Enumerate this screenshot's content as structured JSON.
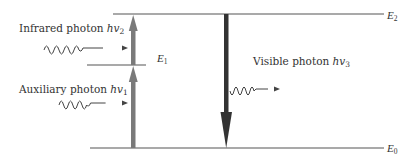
{
  "diagram": {
    "type": "energy-level diagram",
    "levels": [
      {
        "id": "E2",
        "label": "E",
        "sub": "2",
        "y": 14
      },
      {
        "id": "E1",
        "label": "E",
        "sub": "1",
        "y": 65
      },
      {
        "id": "E0",
        "label": "E",
        "sub": "0",
        "y": 148
      }
    ],
    "photons": [
      {
        "id": "infrared",
        "text": "Infrared photon ",
        "hv": "hv",
        "sub": "2"
      },
      {
        "id": "auxiliary",
        "text": "Auxiliary photon ",
        "hv": "hv",
        "sub": "1"
      },
      {
        "id": "visible",
        "text": "Visible photon ",
        "hv": "hv",
        "sub": "3"
      }
    ],
    "transitions": [
      {
        "from": "E0",
        "to": "E1",
        "direction": "up",
        "color": "#7a7a7a"
      },
      {
        "from": "E1",
        "to": "E2",
        "direction": "up",
        "color": "#7a7a7a"
      },
      {
        "from": "E2",
        "to": "E0",
        "direction": "down",
        "color": "#333333"
      }
    ],
    "colors": {
      "line": "#444444",
      "up_arrow": "#7a7a7a",
      "down_arrow": "#333333",
      "wave": "#444444"
    }
  }
}
